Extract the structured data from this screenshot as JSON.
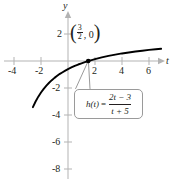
{
  "figure": {
    "type": "graph",
    "background_color": "#ffffff",
    "curve_color": "#000000",
    "axis_color": "#b3b3b3",
    "text_color": "#231f20",
    "box_border_color": "#9a9a9a"
  },
  "axes": {
    "x_label": "t",
    "y_label": "y",
    "x_ticks": [
      "-4",
      "-2",
      "2",
      "4",
      "6"
    ],
    "x_tick_values": [
      -4,
      -2,
      2,
      4,
      6
    ],
    "y_ticks": [
      "2",
      "-2",
      "-4",
      "-6",
      "-8"
    ],
    "y_tick_values": [
      2,
      -2,
      -4,
      -6,
      -8
    ],
    "xlim": [
      -5.2,
      7.0
    ],
    "ylim": [
      -9.2,
      2.8
    ],
    "grid": false
  },
  "annotations": {
    "point": {
      "open_paren": "(",
      "fraction_numerator": "3",
      "fraction_denominator": "2",
      "comma_zero": ", 0",
      "close_paren": ")",
      "x": 1.5,
      "y": 0
    },
    "formula": {
      "lhs": "h(t)",
      "equals": "=",
      "numerator": "2t − 3",
      "denominator": "t + 5"
    }
  },
  "chart_data": {
    "type": "line",
    "title": "",
    "xlabel": "t",
    "ylabel": "y",
    "xlim": [
      -5.2,
      7.0
    ],
    "ylim": [
      -9.2,
      2.8
    ],
    "grid": false,
    "legend": "none",
    "x_ticks": [
      -4,
      -2,
      2,
      4,
      6
    ],
    "y_ticks": [
      2,
      -2,
      -4,
      -6,
      -8
    ],
    "series": [
      {
        "name": "h(t) = (2t - 3)/(t + 5)",
        "x": [
          -2.6,
          -2.4,
          -2.2,
          -2.0,
          -1.8,
          -1.6,
          -1.4,
          -1.2,
          -1.0,
          -0.8,
          -0.6,
          -0.4,
          -0.2,
          0.0,
          0.25,
          0.5,
          0.75,
          1.0,
          1.25,
          1.5,
          1.75,
          2.0,
          2.5,
          3.0,
          3.5,
          4.0,
          4.5,
          5.0,
          5.5,
          6.0,
          6.5,
          6.9
        ],
        "y": [
          -3.42,
          -3.0,
          -2.64,
          -2.33,
          -2.06,
          -1.82,
          -1.61,
          -1.42,
          -1.25,
          -1.1,
          -0.95,
          -0.83,
          -0.71,
          -0.6,
          -0.48,
          -0.36,
          -0.26,
          -0.17,
          -0.08,
          0.0,
          0.07,
          0.14,
          0.27,
          0.38,
          0.47,
          0.56,
          0.63,
          0.7,
          0.76,
          0.82,
          0.87,
          0.91
        ],
        "color": "#000000"
      }
    ],
    "points": [
      {
        "label": "(3/2, 0)",
        "x": 1.5,
        "y": 0
      }
    ],
    "annotations": [
      {
        "text": "h(t) = (2t - 3)/(t + 5)",
        "type": "callout-box"
      }
    ],
    "vertical_asymptote": -5,
    "horizontal_asymptote": 2
  }
}
